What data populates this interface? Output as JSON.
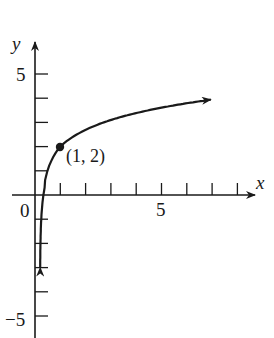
{
  "chart_data": {
    "type": "line",
    "title": "",
    "xlabel": "x",
    "ylabel": "y",
    "function": "y = 2 + ln(x)",
    "x_tick_labels": [
      "0",
      "5"
    ],
    "y_tick_labels": [
      "5",
      "-5"
    ],
    "x_ticks": [
      1,
      2,
      3,
      4,
      5,
      6,
      7,
      8
    ],
    "y_ticks": [
      -5,
      -4,
      -3,
      -2,
      -1,
      1,
      2,
      3,
      4,
      5
    ],
    "xlim": [
      0,
      9
    ],
    "ylim": [
      -6,
      6
    ],
    "grid": false,
    "series": [
      {
        "name": "curve",
        "x": [
          0.007,
          0.02,
          0.05,
          0.1,
          0.2,
          0.5,
          1,
          2,
          3,
          4,
          5,
          6,
          7
        ],
        "y": [
          -2.96,
          -1.91,
          -1.0,
          -0.3,
          0.39,
          1.31,
          2,
          2.69,
          3.1,
          3.39,
          3.61,
          3.79,
          3.95
        ],
        "arrows": "both ends"
      }
    ],
    "annotations": [
      {
        "text": "(1, 2)",
        "x": 1,
        "y": 2,
        "marker": "filled-dot"
      }
    ]
  },
  "labels": {
    "x_axis": "x",
    "y_axis": "y",
    "origin": "0",
    "x_five": "5",
    "y_five": "5",
    "y_neg_five": "−5",
    "point": "(1, 2)"
  }
}
